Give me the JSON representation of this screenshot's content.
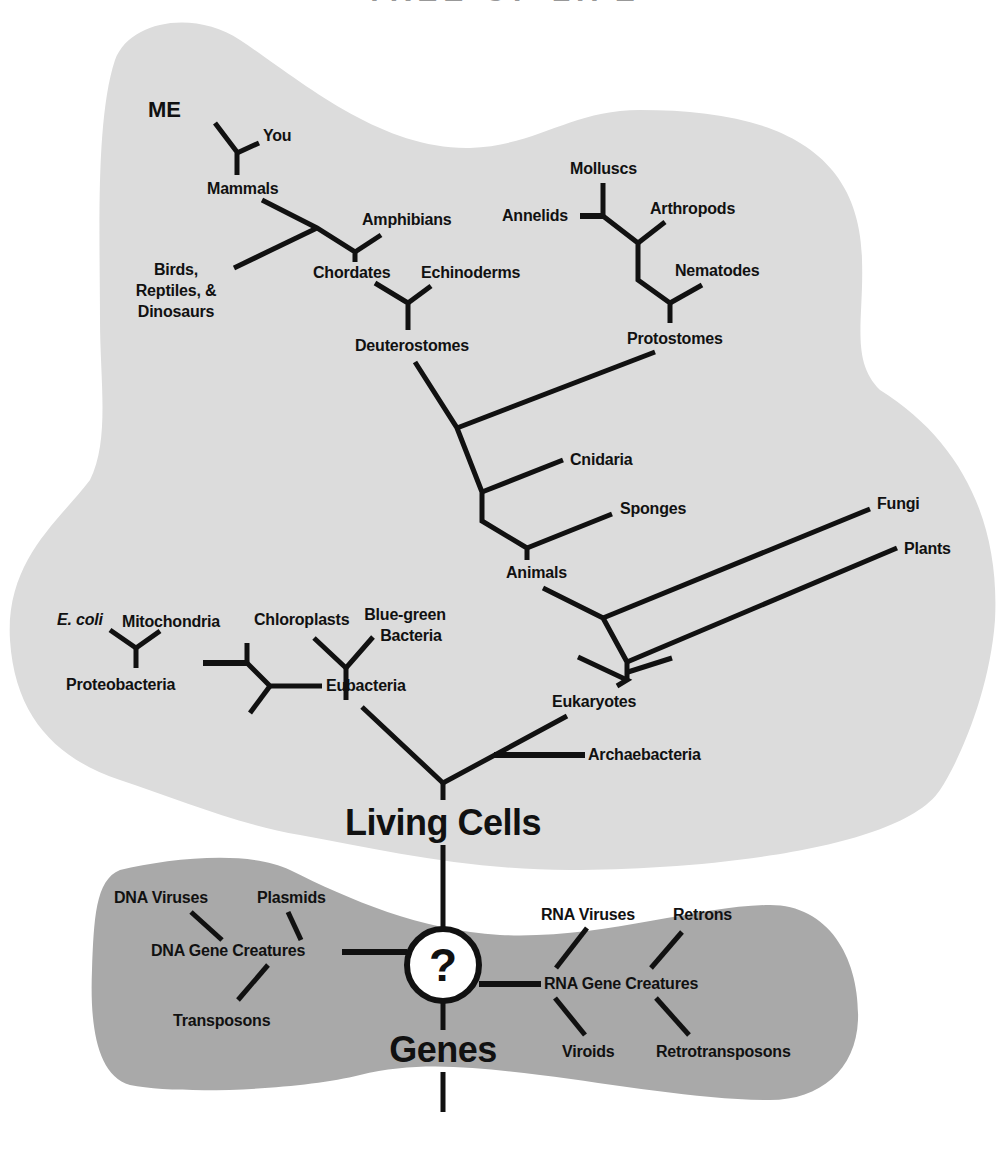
{
  "title": "TREE OF LIFE",
  "colors": {
    "background": "#ffffff",
    "living_cells_region": "#dcdcdc",
    "gene_creatures_region": "#a9a9a9",
    "lines": "#111111",
    "circle_fill": "#ffffff"
  },
  "living_cells": {
    "root_label": "Living Cells",
    "animals_group": {
      "me": "ME",
      "you": "You",
      "mammals": "Mammals",
      "amphibians": "Amphibians",
      "birds": "Birds,",
      "reptiles": "Reptiles, &",
      "dinosaurs": "Dinosaurs",
      "chordates": "Chordates",
      "echinoderms": "Echinoderms",
      "deuterostomes": "Deuterostomes",
      "molluscs": "Molluscs",
      "annelids": "Annelids",
      "arthropods": "Arthropods",
      "nematodes": "Nematodes",
      "protostomes": "Protostomes",
      "cnidaria": "Cnidaria",
      "sponges": "Sponges",
      "animals": "Animals"
    },
    "eukaryotes_group": {
      "fungi": "Fungi",
      "plants": "Plants",
      "eukaryotes": "Eukaryotes"
    },
    "bacteria_group": {
      "ecoli": "E. coli",
      "mitochondria": "Mitochondria",
      "proteobacteria": "Proteobacteria",
      "chloroplasts": "Chloroplasts",
      "blue_green_1": "Blue-green",
      "blue_green_2": "Bacteria",
      "eubacteria": "Eubacteria",
      "archaebacteria": "Archaebacteria"
    }
  },
  "gene_creatures": {
    "origin_symbol": "?",
    "root_label": "Genes",
    "dna": {
      "label": "DNA Gene Creatures",
      "dna_viruses": "DNA Viruses",
      "plasmids": "Plasmids",
      "transposons": "Transposons"
    },
    "rna": {
      "label": "RNA Gene Creatures",
      "rna_viruses": "RNA Viruses",
      "retrons": "Retrons",
      "viroids": "Viroids",
      "retrotransposons": "Retrotransposons"
    }
  }
}
